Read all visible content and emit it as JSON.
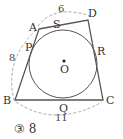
{
  "figure": {
    "type": "tangential-quadrilateral-with-incircle",
    "vertices": {
      "A": "A",
      "B": "B",
      "C": "C",
      "D": "D"
    },
    "tangent_points": {
      "P": "P",
      "S": "S",
      "R": "R",
      "Q": "Q"
    },
    "center": "O",
    "lengths": {
      "AD": "6",
      "AB": "8",
      "BC": "11"
    },
    "colors": {
      "line": "#555555",
      "dashed": "#aaaaaa",
      "text": "#333333"
    }
  },
  "answer": {
    "marker": "③",
    "value": "8"
  }
}
